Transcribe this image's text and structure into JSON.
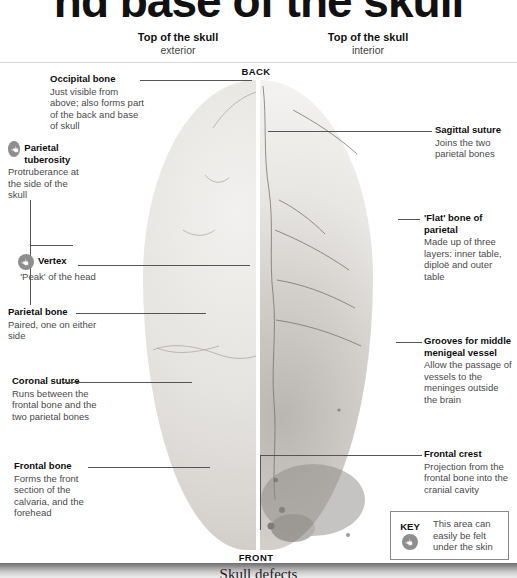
{
  "page_title": "nd base of the skull",
  "headers": {
    "left": {
      "title": "Top of the skull",
      "subtitle": "exterior"
    },
    "right": {
      "title": "Top of the skull",
      "subtitle": "interior"
    }
  },
  "orientation": {
    "back": "BACK",
    "front": "FRONT"
  },
  "callouts_left": [
    {
      "id": "occipital-bone",
      "heading": "Occipital bone",
      "body": "Just visible from above; also forms part of the back and base of skull",
      "touch_icon": false
    },
    {
      "id": "parietal-tuberosity",
      "heading": "Parietal tuberosity",
      "body": "Protruberance at the side of the skull",
      "touch_icon": true
    },
    {
      "id": "vertex",
      "heading": "Vertex",
      "body": "'Peak' of the head",
      "touch_icon": true
    },
    {
      "id": "parietal-bone",
      "heading": "Parietal bone",
      "body": "Paired, one on either side",
      "touch_icon": false
    },
    {
      "id": "coronal-suture",
      "heading": "Coronal suture",
      "body": "Runs between the frontal bone and the two parietal bones",
      "touch_icon": false
    },
    {
      "id": "frontal-bone",
      "heading": "Frontal bone",
      "body": "Forms the front section of the calvaria, and the forehead",
      "touch_icon": false
    }
  ],
  "callouts_right": [
    {
      "id": "sagittal-suture",
      "heading": "Sagittal suture",
      "body": "Joins the two parietal bones",
      "touch_icon": false
    },
    {
      "id": "flat-bone-of-parietal",
      "heading": "'Flat' bone of parietal",
      "body": "Made up of three layers: inner table, diploë and outer table",
      "touch_icon": false
    },
    {
      "id": "grooves-for-middle-menigeal-vessel",
      "heading": "Grooves for middle menigeal vessel",
      "body": "Allow the passage of vessels to the meninges outside the brain",
      "touch_icon": false
    },
    {
      "id": "frontal-crest",
      "heading": "Frontal crest",
      "body": "Projection from the frontal bone into the cranial cavity",
      "touch_icon": false
    }
  ],
  "key": {
    "label": "KEY",
    "icon": "touch-finger-icon",
    "text": "This area can easily be felt under the skin"
  },
  "bottom_band": {
    "title": "Skull defects"
  },
  "colors": {
    "text_dark": "#0d0d0d",
    "text_body": "#4a4a4a",
    "leader_line": "#555555",
    "rule": "#d8d8d8",
    "icon_circle": "#8e8e8e",
    "key_border": "#8a8a8a"
  }
}
